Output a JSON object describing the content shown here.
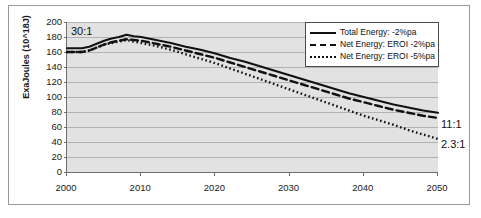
{
  "chart_data": {
    "type": "line",
    "title": "",
    "xlabel": "",
    "ylabel": "ExaJoules (10^18J)",
    "xlim": [
      2000,
      2050
    ],
    "ylim": [
      0,
      200
    ],
    "grid": true,
    "legend_position": "top-right",
    "y_ticks": [
      0,
      20,
      40,
      60,
      80,
      100,
      120,
      140,
      160,
      180,
      200
    ],
    "x_ticks": [
      2000,
      2010,
      2020,
      2030,
      2040,
      2050
    ],
    "x": [
      2000,
      2001,
      2002,
      2003,
      2004,
      2005,
      2006,
      2007,
      2008,
      2009,
      2010,
      2012,
      2014,
      2016,
      2018,
      2020,
      2022,
      2024,
      2026,
      2028,
      2030,
      2032,
      2034,
      2036,
      2038,
      2040,
      2042,
      2044,
      2046,
      2048,
      2050
    ],
    "series": [
      {
        "name": "Total Energy: -2%pa",
        "style": "solid",
        "color": "#111111",
        "values": [
          165,
          165,
          165,
          167,
          171,
          175,
          178,
          180,
          183,
          181,
          180,
          176,
          172,
          167,
          163,
          158,
          152,
          147,
          141,
          135,
          129,
          123,
          117,
          111,
          105,
          100,
          95,
          90,
          86,
          82,
          79
        ]
      },
      {
        "name": "Net Energy: EROI -2%pa",
        "style": "dashed",
        "color": "#111111",
        "values": [
          160,
          160,
          160,
          162,
          166,
          170,
          173,
          175,
          177,
          176,
          175,
          171,
          167,
          162,
          157,
          152,
          146,
          140,
          134,
          128,
          122,
          116,
          110,
          104,
          98,
          93,
          88,
          83,
          79,
          75,
          72
        ]
      },
      {
        "name": "Net Energy: EROI -5%pa",
        "style": "dotted",
        "color": "#111111",
        "values": [
          160,
          160,
          160,
          162,
          166,
          170,
          172,
          174,
          176,
          174,
          172,
          168,
          163,
          157,
          151,
          145,
          138,
          131,
          124,
          117,
          110,
          103,
          96,
          89,
          82,
          75,
          69,
          63,
          56,
          50,
          44
        ]
      }
    ],
    "annotations": [
      {
        "name": "start-eroi",
        "text": "30:1",
        "x": 2000,
        "y": 196,
        "position": "plot-top-left"
      },
      {
        "name": "dashed-end-eroi",
        "text": "11:1",
        "x": 2050,
        "y": 72,
        "position": "right-outside"
      },
      {
        "name": "dotted-end-eroi",
        "text": "2.3:1",
        "x": 2050,
        "y": 44,
        "position": "right-outside"
      }
    ]
  },
  "legend": {
    "items": [
      {
        "label": "Total Energy: -2%pa",
        "style": "solid"
      },
      {
        "label": "Net Energy: EROI -2%pa",
        "style": "dashed"
      },
      {
        "label": "Net Energy: EROI -5%pa",
        "style": "dotted"
      }
    ]
  },
  "colors": {
    "plot_background": "#e2e2e2",
    "gridline": "#b2b2b2",
    "axis": "#6e6e6e",
    "series": "#111111",
    "frame": "#9a9a9a",
    "page_background": "#ffffff"
  }
}
